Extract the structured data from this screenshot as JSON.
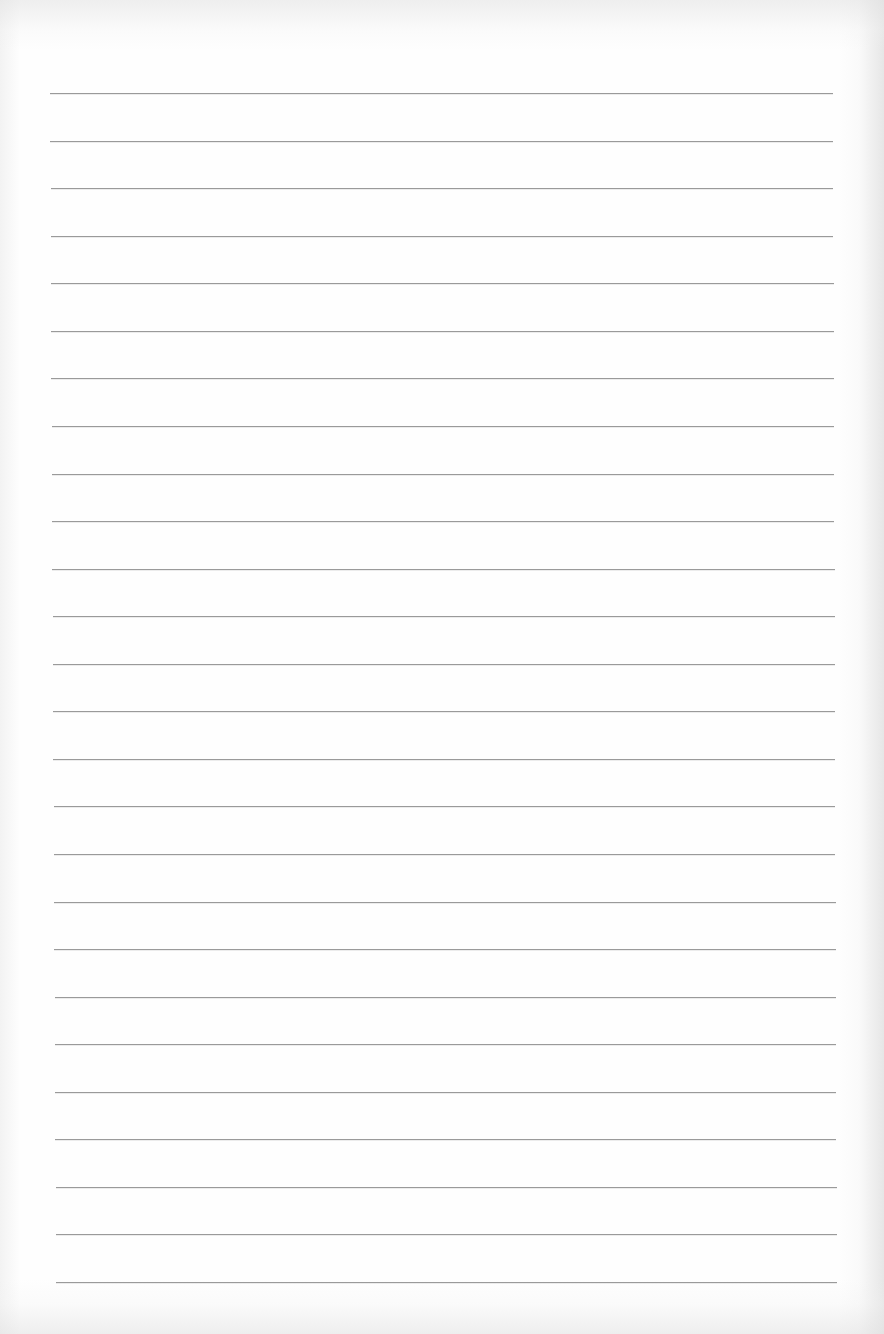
{
  "page": {
    "type": "lined-paper",
    "background_color": "#fefefe",
    "rule_color": "#9a9a9a",
    "rule_count": 26,
    "first_rule_y": 93,
    "rule_spacing": 47.56,
    "rule_left_top": 50,
    "rule_right_top": 833,
    "rule_left_bottom": 56,
    "rule_right_bottom": 837
  }
}
